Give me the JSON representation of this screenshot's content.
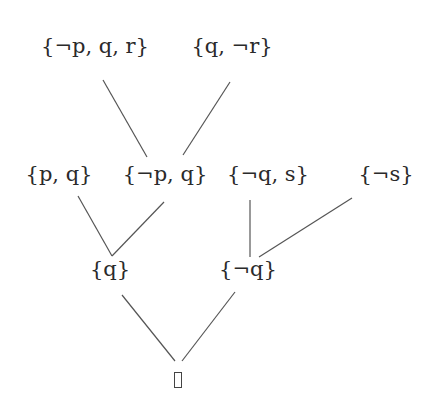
{
  "diagram": {
    "type": "resolution-refutation-tree",
    "nodes": [
      {
        "id": "c1",
        "label": "{¬p, q, r}",
        "x": 95,
        "y": 42
      },
      {
        "id": "c2",
        "label": "{q, ¬r}",
        "x": 232,
        "y": 42
      },
      {
        "id": "c3",
        "label": "{p, q}",
        "x": 59,
        "y": 170
      },
      {
        "id": "c4",
        "label": "{¬p, q}",
        "x": 165,
        "y": 170
      },
      {
        "id": "c5",
        "label": "{¬q, s}",
        "x": 268,
        "y": 170
      },
      {
        "id": "c6",
        "label": "{¬s}",
        "x": 386,
        "y": 170
      },
      {
        "id": "c7",
        "label": "{q}",
        "x": 110,
        "y": 264
      },
      {
        "id": "c8",
        "label": "{¬q}",
        "x": 248,
        "y": 264
      },
      {
        "id": "c9",
        "label": "□",
        "x": 178,
        "y": 372,
        "empty_clause": true
      }
    ],
    "edges": [
      {
        "from": "c1",
        "to": "c4",
        "x1": 103,
        "y1": 80,
        "x2": 147,
        "y2": 157
      },
      {
        "from": "c2",
        "to": "c4",
        "x1": 230,
        "y1": 82,
        "x2": 183,
        "y2": 155
      },
      {
        "from": "c3",
        "to": "c7",
        "x1": 78,
        "y1": 196,
        "x2": 112,
        "y2": 256
      },
      {
        "from": "c4",
        "to": "c7",
        "x1": 164,
        "y1": 202,
        "x2": 112,
        "y2": 256
      },
      {
        "from": "c5",
        "to": "c8",
        "x1": 250,
        "y1": 200,
        "x2": 250,
        "y2": 257
      },
      {
        "from": "c6",
        "to": "c8",
        "x1": 352,
        "y1": 198,
        "x2": 259,
        "y2": 257
      },
      {
        "from": "c7",
        "to": "c9",
        "x1": 122,
        "y1": 295,
        "x2": 175,
        "y2": 361
      },
      {
        "from": "c8",
        "to": "c9",
        "x1": 235,
        "y1": 292,
        "x2": 182,
        "y2": 361
      }
    ],
    "colors": {
      "line": "#555555",
      "text": "#2a2a2a",
      "background": "#ffffff"
    }
  }
}
